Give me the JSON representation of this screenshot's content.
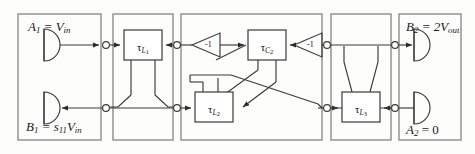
{
  "diagram": {
    "stroke_color": "#3a3a3a",
    "panel_color": "#9a9a9a",
    "background": "#fdfdfc"
  },
  "panels": [
    {
      "name": "source-panel",
      "x": 18,
      "y": 14,
      "w": 83,
      "h": 126
    },
    {
      "name": "stage-L1-panel",
      "x": 113,
      "y": 14,
      "w": 60,
      "h": 126
    },
    {
      "name": "stage-C2-L2-panel",
      "x": 181,
      "y": 14,
      "w": 141,
      "h": 126
    },
    {
      "name": "stage-L3-panel",
      "x": 331,
      "y": 14,
      "w": 60,
      "h": 126
    },
    {
      "name": "load-panel",
      "x": 399,
      "y": 14,
      "w": 62,
      "h": 126
    }
  ],
  "port_labels": [
    {
      "name": "input-wave-label",
      "text_html": "A<span class=\"sub\">1</span> = V<span class=\"sub\">in</span>",
      "x": 28,
      "y": 20,
      "size": 13
    },
    {
      "name": "reflected-wave-label",
      "text_html": "B<span class=\"sub\">1</span> = s<span class=\"sub\">11</span>V<span class=\"sub\">in</span>",
      "x": 26,
      "y": 120,
      "size": 13
    },
    {
      "name": "output-wave-label",
      "text_html": "B<span class=\"sub\">2</span> = 2V<span class=\"sub\">out</span>",
      "x": 406,
      "y": 20,
      "size": 13
    },
    {
      "name": "terminated-port-label",
      "text_html": "A<span class=\"sub\">2</span> <span class=\"rm\">= 0</span>",
      "x": 406,
      "y": 123,
      "size": 13
    }
  ],
  "delay_blocks": [
    {
      "name": "delay-block-L1",
      "label_html": "<span class=\"tau\">&#964;</span><span class=\"sub\">L<span class=\"dg\">1</span></span>",
      "x": 124,
      "y": 30,
      "w": 38,
      "h": 30
    },
    {
      "name": "delay-block-C2",
      "label_html": "<span class=\"tau\">&#964;</span><span class=\"sub\">C<span class=\"dg\">2</span></span>",
      "x": 248,
      "y": 30,
      "w": 38,
      "h": 30
    },
    {
      "name": "delay-block-L2",
      "label_html": "<span class=\"tau\">&#964;</span><span class=\"sub\">L<span class=\"dg\">2</span></span>",
      "x": 195,
      "y": 92,
      "w": 38,
      "h": 30
    },
    {
      "name": "delay-block-L3",
      "label_html": "<span class=\"tau\">&#964;</span><span class=\"sub\">L<span class=\"dg\">3</span></span>",
      "x": 342,
      "y": 92,
      "w": 38,
      "h": 30
    }
  ],
  "amplifiers": [
    {
      "name": "inverter-left",
      "gain": "-1",
      "x": 192,
      "y": 33,
      "w": 28,
      "h": 24
    },
    {
      "name": "inverter-right",
      "gain": "-1",
      "x": 294,
      "y": 33,
      "w": 28,
      "h": 24
    }
  ],
  "wave_terminals": [
    {
      "name": "source-terminal-a1",
      "cx": 52,
      "cy": 45,
      "r": 16,
      "direction": "right"
    },
    {
      "name": "sink-terminal-b1",
      "cx": 52,
      "cy": 108,
      "r": 16,
      "direction": "right"
    },
    {
      "name": "sink-terminal-b2",
      "cx": 422,
      "cy": 45,
      "r": 16,
      "direction": "right"
    },
    {
      "name": "source-terminal-a2",
      "cx": 422,
      "cy": 108,
      "r": 16,
      "direction": "right"
    }
  ],
  "ports": [
    {
      "name": "port-node-1-top",
      "cx": 106,
      "cy": 45
    },
    {
      "name": "port-node-1-bottom",
      "cx": 106,
      "cy": 108
    },
    {
      "name": "port-node-2-top",
      "cx": 177,
      "cy": 45
    },
    {
      "name": "port-node-2-bottom",
      "cx": 177,
      "cy": 108
    },
    {
      "name": "port-node-3-top",
      "cx": 327,
      "cy": 45
    },
    {
      "name": "port-node-3-bottom",
      "cx": 327,
      "cy": 108
    },
    {
      "name": "port-node-4-top",
      "cx": 395,
      "cy": 45
    },
    {
      "name": "port-node-4-bottom",
      "cx": 395,
      "cy": 108
    }
  ]
}
